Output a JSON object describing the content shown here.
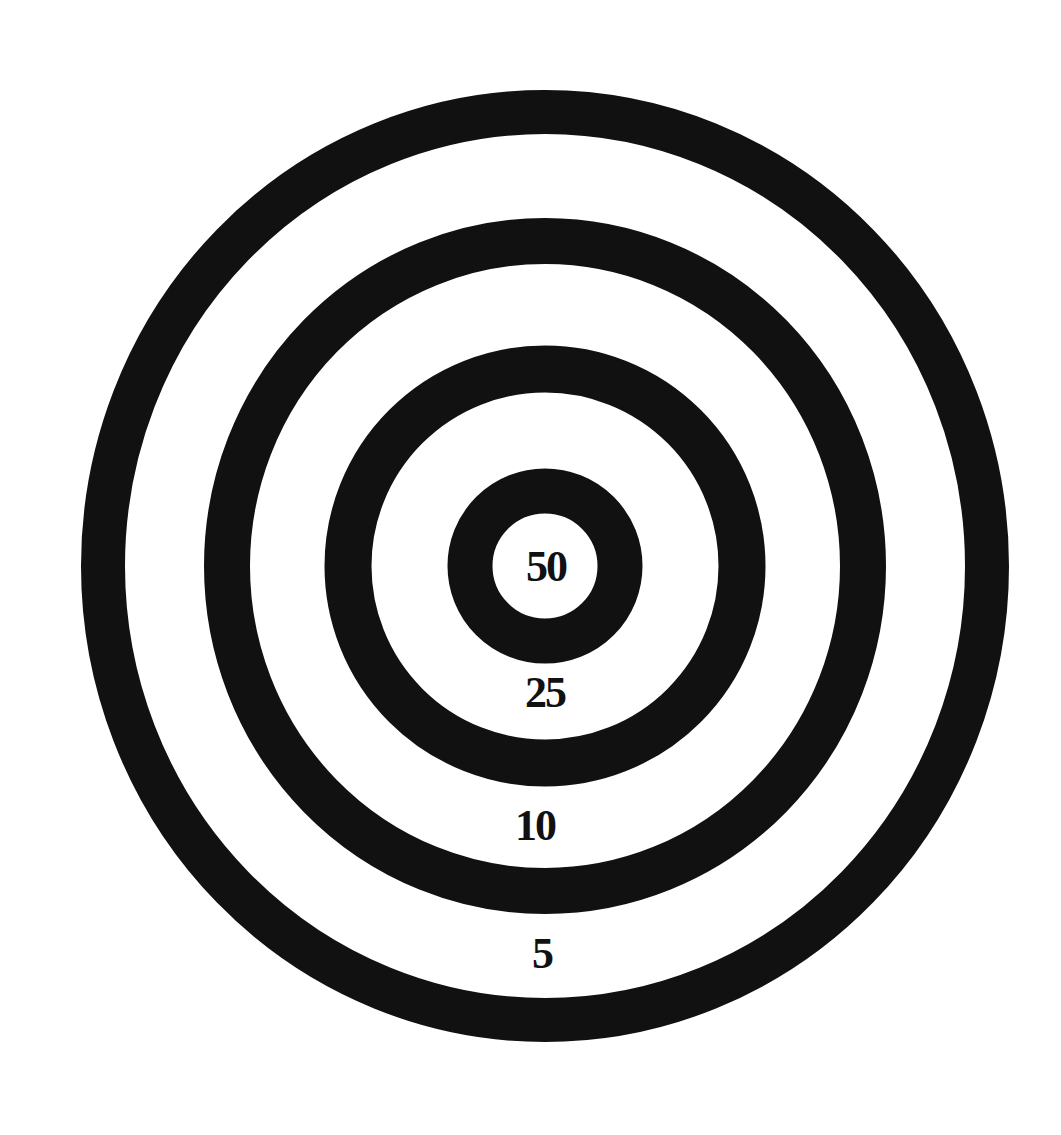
{
  "target": {
    "background_color": "#ffffff",
    "ring_color": "#111111",
    "center": {
      "x": 545,
      "y": 566
    },
    "rings": [
      {
        "name": "outer",
        "rx": 442,
        "ry": 454,
        "stroke_width": 44
      },
      {
        "name": "second",
        "rx": 318,
        "ry": 325,
        "stroke_width": 46
      },
      {
        "name": "third",
        "rx": 197,
        "ry": 197,
        "stroke_width": 47
      },
      {
        "name": "bullseye",
        "rx": 75,
        "ry": 75,
        "stroke_width": 45
      }
    ]
  },
  "labels": [
    {
      "text": "50",
      "zone": "bullseye",
      "x": 546,
      "y": 567
    },
    {
      "text": "25",
      "zone": "third",
      "x": 545,
      "y": 693
    },
    {
      "text": "10",
      "zone": "second",
      "x": 535,
      "y": 826
    },
    {
      "text": "5",
      "zone": "outer",
      "x": 542,
      "y": 954
    }
  ]
}
